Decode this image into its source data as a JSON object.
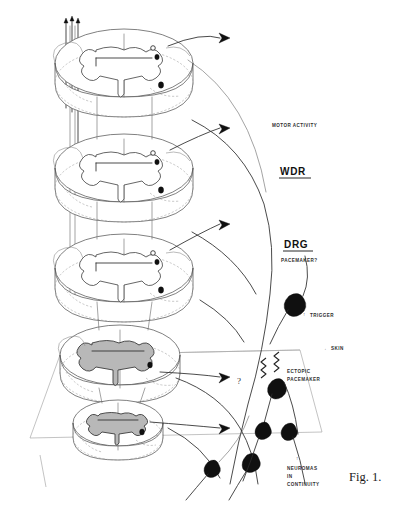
{
  "figure": {
    "caption": "Fig. 1.",
    "title_alt": "Schematic of spinal cord segments, dorsal root ganglion and ectopic pacemaker sites"
  },
  "labels": {
    "motor_activity": "MOTOR ACTIVITY",
    "wdr": "WDR",
    "drg": "DRG",
    "pacemaker_query": "PACEMAKER?",
    "trigger": "TRIGGER",
    "skin": "SKIN",
    "ectopic_line1": "ECTOPIC",
    "ectopic_line2": "PACEMAKER",
    "neuromas_line1": "NEUROMAS",
    "neuromas_line2": "IN",
    "neuromas_line3": "CONTINUITY",
    "question_mark": "?"
  },
  "markers": {
    "skin_arrow": "←",
    "trigger_arrow": "↑",
    "neuromas_arrow": "↑"
  },
  "colors": {
    "ink": "#1a1a1a",
    "line": "#555555",
    "soft_line": "#9a9a9a",
    "gray_matter_fill": "#b8b8b8",
    "soma_fill": "#101010",
    "background": "#ffffff"
  },
  "structure": {
    "cord_segment_count": 6,
    "output_arrow_count": 5,
    "afferent_fiber_count": 3,
    "neuroma_soma_count": 8
  }
}
